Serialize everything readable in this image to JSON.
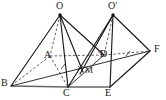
{
  "figure": {
    "background_color": "#ffffff",
    "stroke_color": "#1a1a1a",
    "hidden_stroke_color": "#3c3c3c",
    "base_line_color": "#555555",
    "width": 166,
    "height": 100
  },
  "vertices": [
    {
      "id": "O",
      "label": "O",
      "x": 60,
      "y": 14,
      "label_x": 56,
      "label_y": 1,
      "kind": "apex"
    },
    {
      "id": "O1",
      "label": "O'",
      "x": 113,
      "y": 14,
      "label_x": 108,
      "label_y": 1,
      "kind": "apex"
    },
    {
      "id": "A",
      "label": "A",
      "x": 50,
      "y": 56,
      "label_x": 45,
      "label_y": 50,
      "kind": "hidden"
    },
    {
      "id": "D",
      "label": "D",
      "x": 104,
      "y": 55,
      "label_x": 100,
      "label_y": 49,
      "kind": "hidden"
    },
    {
      "id": "F",
      "label": "F",
      "x": 150,
      "y": 51,
      "label_x": 155,
      "label_y": 45,
      "kind": "visible"
    },
    {
      "id": "B",
      "label": "B",
      "x": 11,
      "y": 86,
      "label_x": 2,
      "label_y": 79,
      "kind": "visible"
    },
    {
      "id": "C",
      "label": "C",
      "x": 68,
      "y": 87,
      "label_x": 64,
      "label_y": 89,
      "kind": "visible"
    },
    {
      "id": "E",
      "label": "E",
      "x": 110,
      "y": 87,
      "label_x": 106,
      "label_y": 89,
      "kind": "visible"
    },
    {
      "id": "M",
      "label": "M",
      "x": 83,
      "y": 71,
      "label_x": 85,
      "label_y": 66,
      "kind": "interior"
    }
  ],
  "edges": [
    {
      "from": "O",
      "to": "B",
      "style": "solid"
    },
    {
      "from": "O",
      "to": "C",
      "style": "solid"
    },
    {
      "from": "O",
      "to": "M",
      "style": "solid"
    },
    {
      "from": "O",
      "to": "D",
      "style": "solid"
    },
    {
      "from": "O",
      "to": "A",
      "style": "dashed"
    },
    {
      "from": "O1",
      "to": "C",
      "style": "solid"
    },
    {
      "from": "O1",
      "to": "E",
      "style": "solid"
    },
    {
      "from": "O1",
      "to": "F",
      "style": "solid"
    },
    {
      "from": "O1",
      "to": "M",
      "style": "solid"
    },
    {
      "from": "O1",
      "to": "D",
      "style": "dashed"
    },
    {
      "from": "A",
      "to": "B",
      "style": "dashed"
    },
    {
      "from": "A",
      "to": "C",
      "style": "dashed"
    },
    {
      "from": "A",
      "to": "D",
      "style": "dashed"
    },
    {
      "from": "D",
      "to": "F",
      "style": "dashed"
    },
    {
      "from": "B",
      "to": "C",
      "style": "base"
    },
    {
      "from": "C",
      "to": "E",
      "style": "base"
    },
    {
      "from": "B",
      "to": "F",
      "style": "solid"
    },
    {
      "from": "E",
      "to": "F",
      "style": "solid"
    },
    {
      "from": "C",
      "to": "D",
      "style": "solid"
    }
  ],
  "marks": [
    {
      "type": "tick",
      "on_edge": "B-F",
      "t": 0.38,
      "name": "congruence-tick-1"
    },
    {
      "type": "tick",
      "on_edge": "D-F",
      "t": 0.52,
      "name": "congruence-tick-2"
    },
    {
      "type": "right-angle",
      "at": "D",
      "name": "right-angle-mark-d"
    }
  ]
}
